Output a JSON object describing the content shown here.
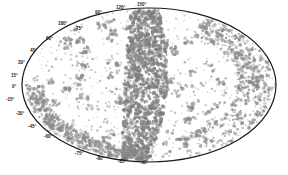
{
  "map": {
    "type": "all-sky projection (Hammer-Aitoff)",
    "center": [
      149,
      85
    ],
    "radii": [
      127,
      77
    ],
    "outline_color": "#1a1a1a",
    "point_color": "#8a8a8a",
    "dense_color": "#7a7a7a",
    "background": "#ffffff",
    "dec_labels_left": [
      {
        "text": "75°",
        "x": 76,
        "y": 30
      },
      {
        "text": "60°",
        "x": 46,
        "y": 40
      },
      {
        "text": "45°",
        "x": 30,
        "y": 52
      },
      {
        "text": "30°",
        "x": 18,
        "y": 64
      },
      {
        "text": "15°",
        "x": 11,
        "y": 77
      },
      {
        "text": "0°",
        "x": 12,
        "y": 88
      },
      {
        "text": "-15°",
        "x": 6,
        "y": 101
      },
      {
        "text": "-30°",
        "x": 16,
        "y": 115
      },
      {
        "text": "-45°",
        "x": 28,
        "y": 128
      },
      {
        "text": "-60°",
        "x": 44,
        "y": 138
      }
    ],
    "ra_labels_top": [
      {
        "text": "90°",
        "x": 95,
        "y": 14
      },
      {
        "text": "120°",
        "x": 116,
        "y": 9
      },
      {
        "text": "150°",
        "x": 137,
        "y": 6
      },
      {
        "text": "180°",
        "x": 58,
        "y": 25
      }
    ],
    "ra_labels_bottom": [
      {
        "text": "-75°",
        "x": 75,
        "y": 155
      },
      {
        "text": "-80°",
        "x": 96,
        "y": 160
      },
      {
        "text": "-85°",
        "x": 118,
        "y": 163
      },
      {
        "text": "-90°",
        "x": 140,
        "y": 164
      }
    ]
  }
}
